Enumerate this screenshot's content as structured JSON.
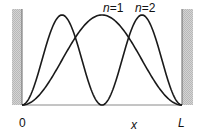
{
  "diagram": {
    "curves": [
      {
        "label": "n=1",
        "n": 1,
        "label_n": "n",
        "label_eq": "=1"
      },
      {
        "label": "n=2",
        "n": 2,
        "label_n": "n",
        "label_eq": "=2"
      }
    ],
    "axis": {
      "origin_label": "0",
      "x_label": "x",
      "end_label": "L"
    },
    "walls": {
      "fill": "#c8c8c8",
      "edge": "#555555"
    },
    "curve_color": "#1a1a1a"
  }
}
